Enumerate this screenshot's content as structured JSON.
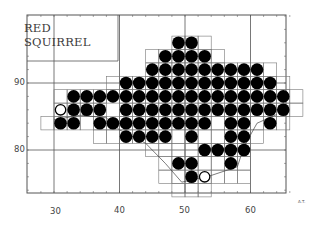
{
  "map": {
    "title_line1": "RED",
    "title_line2": "SQUIRREL",
    "corner_mark": "A.T.",
    "x_axis": {
      "ticks": [
        {
          "value": 30,
          "label": "30"
        },
        {
          "value": 40,
          "label": "40"
        },
        {
          "value": 50,
          "label": "50"
        },
        {
          "value": 60,
          "label": "60"
        }
      ]
    },
    "y_axis": {
      "ticks": [
        {
          "value": 90,
          "label": "90"
        },
        {
          "value": 80,
          "label": "80"
        }
      ]
    },
    "colors": {
      "grid": "#666666",
      "dot": "#000000",
      "open_dot_stroke": "#000000",
      "background": "#ffffff",
      "coast": "#444444"
    },
    "legend": {
      "filled_circle": "recorded presence",
      "open_circle": "old / unconfirmed record"
    },
    "records": {
      "filled": [
        [
          49,
          96
        ],
        [
          51,
          96
        ],
        [
          47,
          94
        ],
        [
          49,
          94
        ],
        [
          51,
          94
        ],
        [
          53,
          94
        ],
        [
          45,
          92
        ],
        [
          47,
          92
        ],
        [
          49,
          92
        ],
        [
          51,
          92
        ],
        [
          53,
          92
        ],
        [
          55,
          92
        ],
        [
          57,
          92
        ],
        [
          59,
          92
        ],
        [
          61,
          92
        ],
        [
          41,
          90
        ],
        [
          43,
          90
        ],
        [
          45,
          90
        ],
        [
          47,
          90
        ],
        [
          49,
          90
        ],
        [
          51,
          90
        ],
        [
          53,
          90
        ],
        [
          55,
          90
        ],
        [
          57,
          90
        ],
        [
          59,
          90
        ],
        [
          61,
          90
        ],
        [
          63,
          90
        ],
        [
          33,
          88
        ],
        [
          35,
          88
        ],
        [
          37,
          88
        ],
        [
          39,
          88
        ],
        [
          41,
          88
        ],
        [
          43,
          88
        ],
        [
          45,
          88
        ],
        [
          47,
          88
        ],
        [
          49,
          88
        ],
        [
          51,
          88
        ],
        [
          53,
          88
        ],
        [
          55,
          88
        ],
        [
          57,
          88
        ],
        [
          59,
          88
        ],
        [
          61,
          88
        ],
        [
          63,
          88
        ],
        [
          65,
          88
        ],
        [
          33,
          86
        ],
        [
          35,
          86
        ],
        [
          37,
          86
        ],
        [
          41,
          86
        ],
        [
          43,
          86
        ],
        [
          45,
          86
        ],
        [
          47,
          86
        ],
        [
          49,
          86
        ],
        [
          51,
          86
        ],
        [
          53,
          86
        ],
        [
          55,
          86
        ],
        [
          57,
          86
        ],
        [
          59,
          86
        ],
        [
          61,
          86
        ],
        [
          63,
          86
        ],
        [
          65,
          86
        ],
        [
          31,
          84
        ],
        [
          33,
          84
        ],
        [
          37,
          84
        ],
        [
          39,
          84
        ],
        [
          41,
          84
        ],
        [
          43,
          84
        ],
        [
          45,
          84
        ],
        [
          47,
          84
        ],
        [
          49,
          84
        ],
        [
          51,
          84
        ],
        [
          53,
          84
        ],
        [
          57,
          84
        ],
        [
          59,
          84
        ],
        [
          63,
          84
        ],
        [
          41,
          82
        ],
        [
          43,
          82
        ],
        [
          45,
          82
        ],
        [
          47,
          82
        ],
        [
          51,
          82
        ],
        [
          57,
          82
        ],
        [
          59,
          82
        ],
        [
          53,
          80
        ],
        [
          55,
          80
        ],
        [
          57,
          80
        ],
        [
          59,
          80
        ],
        [
          49,
          78
        ],
        [
          51,
          78
        ],
        [
          57,
          78
        ],
        [
          51,
          76
        ]
      ],
      "open": [
        [
          31,
          86
        ],
        [
          53,
          76
        ]
      ]
    }
  }
}
